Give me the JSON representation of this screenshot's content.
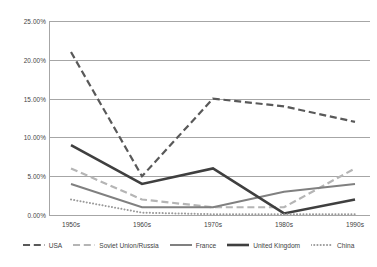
{
  "chart_data": {
    "type": "line",
    "title": "",
    "xlabel": "",
    "ylabel": "",
    "categories": [
      "1950s",
      "1960s",
      "1970s",
      "1980s",
      "1990s"
    ],
    "ylim": [
      0,
      25
    ],
    "ytick_labels": [
      "0.00%",
      "5.00%",
      "10.00%",
      "15.00%",
      "20.00%",
      "25.00%"
    ],
    "ytick_values": [
      0,
      5,
      10,
      15,
      20,
      25
    ],
    "grid": true,
    "legend_position": "bottom",
    "series": [
      {
        "name": "USA",
        "values": [
          21.0,
          5.0,
          15.0,
          14.0,
          12.0
        ],
        "style": "dashed",
        "color": "#595959",
        "width": 2.2
      },
      {
        "name": "Soviet Union/Russia",
        "values": [
          6.0,
          2.0,
          1.0,
          1.0,
          6.0
        ],
        "style": "dashed-light",
        "color": "#b5b5b5",
        "width": 2.2
      },
      {
        "name": "France",
        "values": [
          4.0,
          1.0,
          1.0,
          3.0,
          4.0
        ],
        "style": "solid",
        "color": "#808080",
        "width": 2.0
      },
      {
        "name": "United Kingdom",
        "values": [
          9.0,
          4.0,
          6.0,
          0.2,
          2.0
        ],
        "style": "solid",
        "color": "#3f3f3f",
        "width": 2.6
      },
      {
        "name": "China",
        "values": [
          2.0,
          0.3,
          0.1,
          0.1,
          0.1
        ],
        "style": "dotted",
        "color": "#9a9a9a",
        "width": 2.0
      }
    ]
  },
  "colors": {
    "grid": "#a6a6a6",
    "text": "#3f3f3f",
    "background": "#ffffff"
  }
}
